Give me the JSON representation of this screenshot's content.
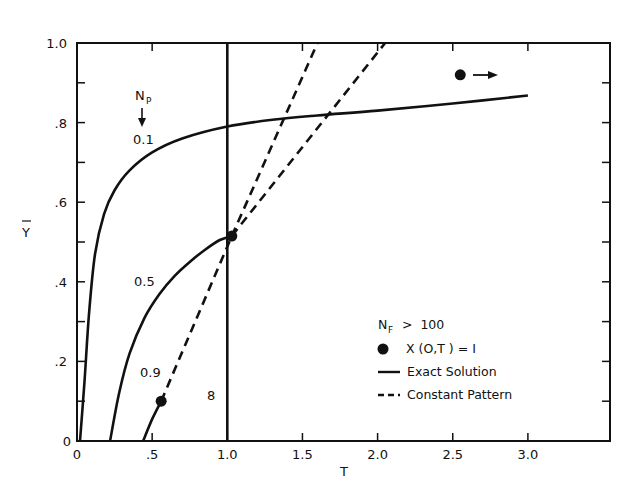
{
  "chart_data": {
    "type": "line",
    "title": "",
    "xlabel": "T",
    "ylabel": "Ȳ",
    "xlim": [
      0,
      3.5
    ],
    "ylim": [
      0,
      1.0
    ],
    "grid": false,
    "legend_position": "lower right (inside)",
    "x_ticks": [
      0,
      0.5,
      1.0,
      1.5,
      2.0,
      2.5,
      3.0
    ],
    "x_tick_labels": [
      "0",
      ".5",
      "1.0",
      "1.5",
      "2.0",
      "2.5",
      "3.0"
    ],
    "y_ticks": [
      0,
      0.2,
      0.4,
      0.6,
      0.8,
      1.0
    ],
    "y_tick_labels": [
      "0",
      ".2",
      ".4",
      ".6",
      ".8",
      "1.0"
    ],
    "legend": {
      "header": "N_F > 100",
      "entries": [
        {
          "marker": "dot",
          "label": "X (O,T) = I"
        },
        {
          "marker": "solid",
          "label": "Exact Solution"
        },
        {
          "marker": "dashed",
          "label": "Constant Pattern"
        }
      ]
    },
    "annotations": [
      {
        "text": "N_P",
        "x": 0.42,
        "y": 0.89
      },
      {
        "text": "↓",
        "x": 0.42,
        "y": 0.83
      },
      {
        "text": "0.1",
        "x": 0.42,
        "y": 0.78
      },
      {
        "text": "0.5",
        "x": 0.43,
        "y": 0.37
      },
      {
        "text": "0.9",
        "x": 0.43,
        "y": 0.14
      },
      {
        "text": "8",
        "x": 0.9,
        "y": 0.11
      },
      {
        "text": "● →",
        "x": 2.55,
        "y": 0.92
      }
    ],
    "series": [
      {
        "name": "Exact Solution N_P = 0.1",
        "style": "solid",
        "x": [
          0.02,
          0.05,
          0.08,
          0.12,
          0.18,
          0.25,
          0.35,
          0.5,
          0.7,
          1.0,
          1.3,
          1.6,
          2.0,
          2.5,
          3.0
        ],
        "y": [
          0.0,
          0.15,
          0.32,
          0.47,
          0.57,
          0.63,
          0.68,
          0.725,
          0.76,
          0.79,
          0.807,
          0.818,
          0.83,
          0.848,
          0.868
        ]
      },
      {
        "name": "Exact Solution N_P = 0.5",
        "style": "solid",
        "x": [
          0.22,
          0.28,
          0.35,
          0.45,
          0.55,
          0.65,
          0.75,
          0.85,
          0.95,
          1.03
        ],
        "y": [
          0.0,
          0.12,
          0.22,
          0.31,
          0.37,
          0.415,
          0.45,
          0.48,
          0.505,
          0.515
        ]
      },
      {
        "name": "Exact Solution N_P = 0.9",
        "style": "solid",
        "x": [
          0.44,
          0.5,
          0.56
        ],
        "y": [
          0.0,
          0.055,
          0.1
        ]
      },
      {
        "name": "Constant Pattern N_P = 0.9",
        "style": "dashed",
        "x": [
          0.56,
          1.03
        ],
        "y": [
          0.1,
          0.515
        ]
      },
      {
        "name": "Constant Pattern (steep)",
        "style": "dashed",
        "x": [
          1.03,
          1.6
        ],
        "y": [
          0.515,
          1.0
        ]
      },
      {
        "name": "Constant Pattern (shallow)",
        "style": "dashed",
        "x": [
          1.03,
          2.05
        ],
        "y": [
          0.515,
          1.0
        ]
      },
      {
        "name": "Exact Solution N_P = ∞ (vertical)",
        "style": "solid",
        "x": [
          1.0,
          1.0
        ],
        "y": [
          0.0,
          1.0
        ]
      }
    ],
    "points": [
      {
        "label": "X(O,T)=1",
        "x": 0.56,
        "y": 0.1
      },
      {
        "label": "X(O,T)=1",
        "x": 1.03,
        "y": 0.515
      },
      {
        "label": "X(O,T)=1 (off-scale, arrow →)",
        "x": 2.55,
        "y": 0.92
      }
    ]
  },
  "labels": {
    "x_axis_title": "T",
    "y_axis_title": "Ȳ",
    "np_label": "N",
    "np_sub": "P",
    "np_arrow": "↓",
    "curve_01": "0.1",
    "curve_05": "0.5",
    "curve_09": "0.9",
    "curve_inf": "8",
    "origin_y": "0",
    "legend_header_main": "N",
    "legend_header_sub": "F",
    "legend_header_rest": " >  100",
    "legend_dot": "X (O,T ) = I",
    "legend_solid": "Exact  Solution",
    "legend_dashed": "Constant  Pattern",
    "arrow_right": "→"
  },
  "colors": {
    "ink": "#111111",
    "background": "#ffffff"
  }
}
